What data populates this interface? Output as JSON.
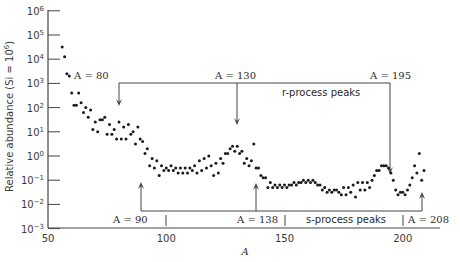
{
  "chart_data": {
    "type": "scatter",
    "title": "",
    "xlabel": "A",
    "ylabel": "Relative abundance (Si = 10^6)",
    "xlim": [
      50,
      215
    ],
    "ylim_log10": [
      -3,
      6
    ],
    "yscale": "log",
    "grid": false,
    "x_ticks": [
      50,
      100,
      150,
      200
    ],
    "y_ticks": [
      "10^6",
      "10^5",
      "10^4",
      "10^3",
      "10^2",
      "10^1",
      "10^0",
      "10^-1",
      "10^-2",
      "10^-3"
    ],
    "series": [
      {
        "name": "Solar-system abundances",
        "points": [
          [
            56,
            4.5
          ],
          [
            57,
            4.1
          ],
          [
            58,
            3.4
          ],
          [
            59,
            3.3
          ],
          [
            60,
            2.6
          ],
          [
            61,
            2.1
          ],
          [
            62,
            2.1
          ],
          [
            63,
            2.6
          ],
          [
            64,
            2.2
          ],
          [
            65,
            1.8
          ],
          [
            66,
            2.0
          ],
          [
            67,
            1.6
          ],
          [
            68,
            1.9
          ],
          [
            69,
            1.1
          ],
          [
            70,
            1.4
          ],
          [
            71,
            1.0
          ],
          [
            72,
            1.5
          ],
          [
            73,
            1.5
          ],
          [
            74,
            1.6
          ],
          [
            75,
            0.9
          ],
          [
            76,
            1.3
          ],
          [
            77,
            0.9
          ],
          [
            78,
            1.1
          ],
          [
            79,
            0.7
          ],
          [
            80,
            1.4
          ],
          [
            81,
            0.7
          ],
          [
            82,
            1.2
          ],
          [
            83,
            0.7
          ],
          [
            84,
            1.3
          ],
          [
            85,
            0.9
          ],
          [
            86,
            1.0
          ],
          [
            87,
            0.5
          ],
          [
            88,
            1.2
          ],
          [
            89,
            0.7
          ],
          [
            90,
            0.6
          ],
          [
            91,
            0.1
          ],
          [
            92,
            0.3
          ],
          [
            93,
            -0.4
          ],
          [
            94,
            -0.1
          ],
          [
            95,
            -0.5
          ],
          [
            96,
            -0.2
          ],
          [
            97,
            -0.8
          ],
          [
            98,
            -0.4
          ],
          [
            99,
            -0.6
          ],
          [
            100,
            -0.5
          ],
          [
            101,
            -0.6
          ],
          [
            102,
            -0.4
          ],
          [
            103,
            -0.6
          ],
          [
            104,
            -0.5
          ],
          [
            105,
            -0.7
          ],
          [
            106,
            -0.5
          ],
          [
            107,
            -0.7
          ],
          [
            108,
            -0.5
          ],
          [
            109,
            -0.7
          ],
          [
            110,
            -0.5
          ],
          [
            111,
            -0.6
          ],
          [
            112,
            -0.4
          ],
          [
            113,
            -0.7
          ],
          [
            114,
            -0.2
          ],
          [
            115,
            -0.6
          ],
          [
            116,
            -0.1
          ],
          [
            117,
            -0.5
          ],
          [
            118,
            0.0
          ],
          [
            119,
            -0.4
          ],
          [
            120,
            -0.8
          ],
          [
            121,
            -0.3
          ],
          [
            122,
            -0.7
          ],
          [
            123,
            -0.1
          ],
          [
            124,
            -0.3
          ],
          [
            125,
            0.1
          ],
          [
            126,
            0.1
          ],
          [
            127,
            0.3
          ],
          [
            128,
            0.4
          ],
          [
            129,
            0.2
          ],
          [
            130,
            0.4
          ],
          [
            131,
            0.1
          ],
          [
            132,
            0.2
          ],
          [
            133,
            -0.3
          ],
          [
            134,
            -0.1
          ],
          [
            135,
            -0.4
          ],
          [
            136,
            -0.2
          ],
          [
            137,
            0.5
          ],
          [
            138,
            -0.5
          ],
          [
            139,
            -0.5
          ],
          [
            140,
            -0.8
          ],
          [
            141,
            -0.9
          ],
          [
            142,
            -0.9
          ],
          [
            143,
            -1.3
          ],
          [
            144,
            -1.1
          ],
          [
            145,
            -1.3
          ],
          [
            146,
            -1.2
          ],
          [
            147,
            -1.3
          ],
          [
            148,
            -1.2
          ],
          [
            149,
            -1.3
          ],
          [
            150,
            -1.2
          ],
          [
            151,
            -1.3
          ],
          [
            152,
            -1.2
          ],
          [
            153,
            -1.2
          ],
          [
            154,
            -1.1
          ],
          [
            155,
            -1.2
          ],
          [
            156,
            -1.1
          ],
          [
            157,
            -1.1
          ],
          [
            158,
            -1.0
          ],
          [
            159,
            -1.1
          ],
          [
            160,
            -1.0
          ],
          [
            161,
            -1.1
          ],
          [
            162,
            -1.0
          ],
          [
            163,
            -1.1
          ],
          [
            164,
            -1.2
          ],
          [
            165,
            -1.2
          ],
          [
            166,
            -1.4
          ],
          [
            167,
            -1.3
          ],
          [
            168,
            -1.5
          ],
          [
            169,
            -1.4
          ],
          [
            170,
            -1.5
          ],
          [
            171,
            -1.4
          ],
          [
            172,
            -1.4
          ],
          [
            173,
            -1.5
          ],
          [
            174,
            -1.6
          ],
          [
            175,
            -1.3
          ],
          [
            176,
            -1.6
          ],
          [
            177,
            -1.3
          ],
          [
            178,
            -1.5
          ],
          [
            179,
            -1.2
          ],
          [
            180,
            -1.7
          ],
          [
            181,
            -1.1
          ],
          [
            182,
            -1.4
          ],
          [
            183,
            -1.1
          ],
          [
            184,
            -1.4
          ],
          [
            185,
            -1.1
          ],
          [
            186,
            -1.3
          ],
          [
            187,
            -1.0
          ],
          [
            188,
            -0.8
          ],
          [
            189,
            -0.6
          ],
          [
            190,
            -0.6
          ],
          [
            191,
            -0.4
          ],
          [
            192,
            -0.4
          ],
          [
            193,
            -0.4
          ],
          [
            194,
            -0.5
          ],
          [
            195,
            -0.7
          ],
          [
            196,
            -1.0
          ],
          [
            197,
            -1.4
          ],
          [
            198,
            -1.6
          ],
          [
            199,
            -1.5
          ],
          [
            200,
            -1.5
          ],
          [
            201,
            -1.6
          ],
          [
            202,
            -1.4
          ],
          [
            203,
            -1.2
          ],
          [
            204,
            -0.9
          ],
          [
            205,
            -0.4
          ],
          [
            206,
            -0.7
          ],
          [
            207,
            0.1
          ],
          [
            208,
            -1.0
          ],
          [
            209,
            -0.6
          ]
        ],
        "point_format": "[A, log10(abundance)]"
      }
    ],
    "annotations": [
      {
        "text": "A = 80",
        "x": 80,
        "group": "r-process",
        "direction": "down"
      },
      {
        "text": "A = 130",
        "x": 130,
        "group": "r-process",
        "direction": "down"
      },
      {
        "text": "A = 195",
        "x": 195,
        "group": "r-process",
        "direction": "down"
      },
      {
        "text": "r-process peaks",
        "group": "r-process"
      },
      {
        "text": "A = 90",
        "x": 90,
        "group": "s-process",
        "direction": "up"
      },
      {
        "text": "A = 138",
        "x": 138,
        "group": "s-process",
        "direction": "up"
      },
      {
        "text": "A = 208",
        "x": 208,
        "group": "s-process",
        "direction": "up"
      },
      {
        "text": "s-process peaks",
        "group": "s-process"
      }
    ]
  },
  "labels": {
    "xlabel": "A",
    "ylabel": "Relative abundance (Si = 10",
    "ylabel_sup": "6",
    "ylabel_close": ")",
    "x_ticks": [
      "50",
      "100",
      "150",
      "200"
    ],
    "y_ticks": [
      {
        "base": "10",
        "exp": "6"
      },
      {
        "base": "10",
        "exp": "5"
      },
      {
        "base": "10",
        "exp": "4"
      },
      {
        "base": "10",
        "exp": "3"
      },
      {
        "base": "10",
        "exp": "2"
      },
      {
        "base": "10",
        "exp": "1"
      },
      {
        "base": "10",
        "exp": "0"
      },
      {
        "base": "10",
        "exp": "−1"
      },
      {
        "base": "10",
        "exp": "−2"
      },
      {
        "base": "10",
        "exp": "−3"
      }
    ],
    "r_a80": "A = 80",
    "r_a130": "A = 130",
    "r_a195": "A = 195",
    "r_title": "r-process peaks",
    "s_a90": "A = 90",
    "s_a138": "A = 138",
    "s_a208": "A = 208",
    "s_title": "s-process peaks"
  }
}
